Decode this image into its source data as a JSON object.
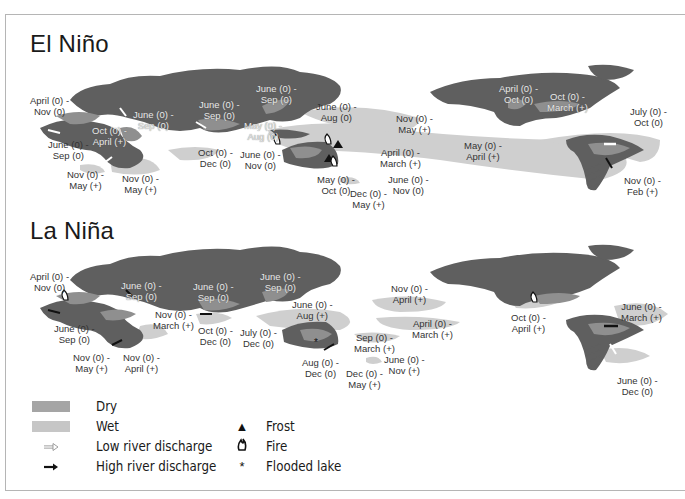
{
  "colors": {
    "land": "#5f5f5f",
    "dry": "#9a9a9a",
    "wet": "#cfcfcf",
    "frame": "#b5b5b5",
    "text": "#1a1a1a"
  },
  "panels": [
    {
      "title": "El Niño",
      "labels": [
        {
          "text": "April (0) -\nNov (0)",
          "x": 30,
          "y": 96
        },
        {
          "text": "June (0) -\nSep (0)",
          "x": 50,
          "y": 142
        },
        {
          "text": "Nov (0) -\nMay (+)",
          "x": 70,
          "y": 172
        },
        {
          "text": "Nov (0) -\nMay (+)",
          "x": 122,
          "y": 176
        },
        {
          "text": "June (0) -\nSep (0)",
          "x": 134,
          "y": 112,
          "inverted": true
        },
        {
          "text": "Oct (0) -\nApril (+)",
          "x": 92,
          "y": 128,
          "inverted": true
        },
        {
          "text": "June (0) -\nSep (0)",
          "x": 200,
          "y": 100,
          "inverted": true
        },
        {
          "text": "Oct (0) -\nDec (0)",
          "x": 198,
          "y": 150
        },
        {
          "text": "June (0) -\nSep (0)",
          "x": 256,
          "y": 86,
          "inverted": true
        },
        {
          "text": "May (0) -\nAug (0)",
          "x": 244,
          "y": 123,
          "inverted": true
        },
        {
          "text": "June (0) -\nNov (0)",
          "x": 240,
          "y": 152
        },
        {
          "text": "June (0) -\nAug (0)",
          "x": 318,
          "y": 104
        },
        {
          "text": "May (0) -\nOct (0)",
          "x": 318,
          "y": 177
        },
        {
          "text": "Dec (0) -\nMay (+)",
          "x": 352,
          "y": 190
        },
        {
          "text": "April (0) -\nMarch (+)",
          "x": 380,
          "y": 150
        },
        {
          "text": "June (0) -\nNov (0)",
          "x": 390,
          "y": 176
        },
        {
          "text": "Nov (0) -\nMay (+)",
          "x": 396,
          "y": 116
        },
        {
          "text": "May (0) -\nApril (+)",
          "x": 464,
          "y": 142
        },
        {
          "text": "April (0) -\nOct (0)",
          "x": 500,
          "y": 86,
          "inverted": true
        },
        {
          "text": "Oct (0) -\nMarch (+)",
          "x": 548,
          "y": 94,
          "inverted": true
        },
        {
          "text": "July (0) -\nOct (0)",
          "x": 630,
          "y": 108
        },
        {
          "text": "Nov (0) -\nFeb (+)",
          "x": 625,
          "y": 177
        }
      ]
    },
    {
      "title": "La Niña",
      "labels": [
        {
          "text": "April (0) -\nNov (0)",
          "x": 30,
          "y": 271
        },
        {
          "text": "June (0) -\nSep (0)",
          "x": 55,
          "y": 324
        },
        {
          "text": "Nov (0) -\nMay (+)",
          "x": 74,
          "y": 353
        },
        {
          "text": "Nov (0) -\nApril (+)",
          "x": 124,
          "y": 353
        },
        {
          "text": "June (0) -\nSep (0)",
          "x": 122,
          "y": 281,
          "inverted": true
        },
        {
          "text": "Nov (0) -\nMarch (+)",
          "x": 154,
          "y": 310
        },
        {
          "text": "June (0) -\nSep (0)",
          "x": 200,
          "y": 283,
          "inverted": true
        },
        {
          "text": "Oct (0) -\nDec (0)",
          "x": 198,
          "y": 326
        },
        {
          "text": "June (0) -\nSep (0)",
          "x": 260,
          "y": 271,
          "inverted": true
        },
        {
          "text": "July (0) -\nDec (0)",
          "x": 242,
          "y": 328
        },
        {
          "text": "June (0) -\nAug (+)",
          "x": 308,
          "y": 298
        },
        {
          "text": "Aug (0) -\nDec (0)",
          "x": 318,
          "y": 357
        },
        {
          "text": "Sep (0) -\nMarch (+)",
          "x": 370,
          "y": 333
        },
        {
          "text": "Dec (0) -\nMay (+)",
          "x": 361,
          "y": 370
        },
        {
          "text": "June (0) -\nNov (+)",
          "x": 402,
          "y": 354
        },
        {
          "text": "Nov (0) -\nApril (+)",
          "x": 408,
          "y": 283
        },
        {
          "text": "April (0) -\nMarch (+)",
          "x": 428,
          "y": 319
        },
        {
          "text": "Oct (0) -\nApril (+)",
          "x": 527,
          "y": 313
        },
        {
          "text": "June (0) -\nMarch (+)",
          "x": 640,
          "y": 302
        },
        {
          "text": "June (0) -\nDec (0)",
          "x": 640,
          "y": 376
        }
      ]
    }
  ],
  "legend": {
    "items": [
      {
        "symbol": "swatch-dark",
        "label": "Dry"
      },
      {
        "symbol": "swatch-light",
        "label": "Wet"
      },
      {
        "symbol": "⇨",
        "label": "Low river discharge"
      },
      {
        "symbol": "➞",
        "label": "High river discharge"
      },
      {
        "symbol": "▲",
        "label": "Frost"
      },
      {
        "symbol": "🔥",
        "label": "Fire"
      },
      {
        "symbol": "*",
        "label": "Flooded lake"
      }
    ]
  }
}
